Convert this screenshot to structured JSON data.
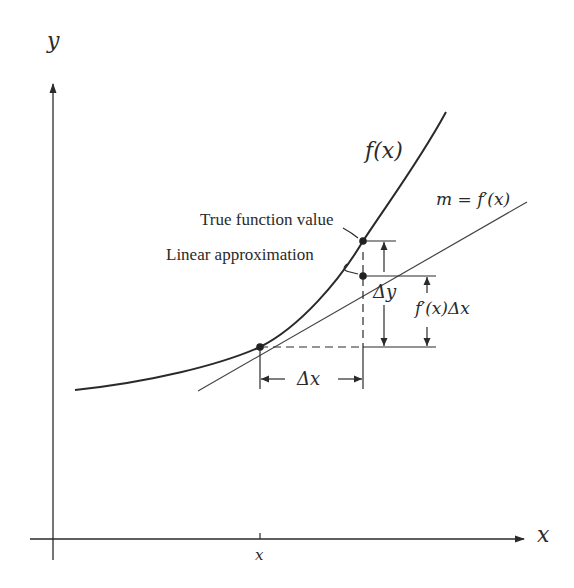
{
  "diagram": {
    "axes": {
      "x_label": "x",
      "y_label": "y",
      "x_tick_label": "x"
    },
    "curve_label": "f(x)",
    "tangent_label": "m = f′(x)",
    "annotations": {
      "true_value": "True function value",
      "linear_approx": "Linear approximation",
      "delta_y": "Δy",
      "fprime_dx": "f′(x)Δx",
      "delta_x": "Δx"
    },
    "colors": {
      "line": "#2a2a2a",
      "tangent": "#444444",
      "background": "#ffffff"
    }
  }
}
